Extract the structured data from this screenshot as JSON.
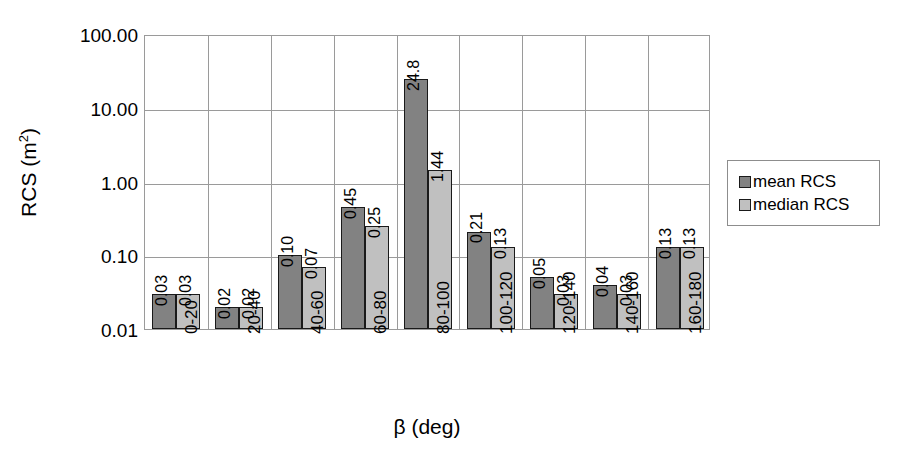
{
  "chart_data": {
    "type": "bar",
    "title": "",
    "xlabel": "β (deg)",
    "ylabel": "RCS (m²)",
    "ylabel_base": "RCS (m",
    "ylabel_sup": "2",
    "ylabel_tail": ")",
    "yscale": "log",
    "ylim": [
      0.01,
      100
    ],
    "grid": true,
    "legend_position": "right",
    "categories": [
      "0-20",
      "20-40",
      "40-60",
      "60-80",
      "80-100",
      "100-120",
      "120-140",
      "140-160",
      "160-180"
    ],
    "ytick_labels": [
      "100.00",
      "10.00",
      "1.00",
      "0.10",
      "0.01"
    ],
    "ytick_values": [
      100,
      10,
      1,
      0.1,
      0.01
    ],
    "series": [
      {
        "name": "mean RCS",
        "color": "#828282",
        "values": [
          0.03,
          0.02,
          0.1,
          0.45,
          24.8,
          0.21,
          0.05,
          0.04,
          0.13
        ],
        "labels": [
          "0.03",
          "0.02",
          "0.10",
          "0.45",
          "24.8",
          "0.21",
          "0.05",
          "0.04",
          "0.13"
        ]
      },
      {
        "name": "median RCS",
        "color": "#c0c0c0",
        "values": [
          0.03,
          0.02,
          0.07,
          0.25,
          1.44,
          0.13,
          0.03,
          0.03,
          0.13
        ],
        "labels": [
          "0.03",
          "0.02",
          "0.07",
          "0.25",
          "1.44",
          "0.13",
          "0.03",
          "0.03",
          "0.13"
        ]
      }
    ]
  },
  "legend": {
    "items": [
      {
        "label": "mean RCS",
        "swatch": "mean"
      },
      {
        "label": "median RCS",
        "swatch": "median"
      }
    ]
  }
}
